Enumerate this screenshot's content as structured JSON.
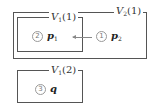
{
  "diagram": {
    "outer_box": {
      "label": {
        "name": "V",
        "sub": "2",
        "arg": "(1)"
      }
    },
    "inner_box": {
      "label": {
        "name": "V",
        "sub": "1",
        "arg": "(1)"
      },
      "item": {
        "number": "2",
        "var": "p",
        "var_sub": "1"
      }
    },
    "outer_item": {
      "number": "1",
      "var": "p",
      "var_sub": "2"
    },
    "lower_box": {
      "label": {
        "name": "V",
        "sub": "1",
        "arg": "(2)"
      },
      "item": {
        "number": "3",
        "var": "q",
        "var_sub": ""
      }
    },
    "arrow": {
      "from": "p2",
      "to": "V1(1)",
      "direction": "left"
    },
    "colors": {
      "border": "#555555",
      "circle": "#999999",
      "arrow": "#888888"
    }
  }
}
